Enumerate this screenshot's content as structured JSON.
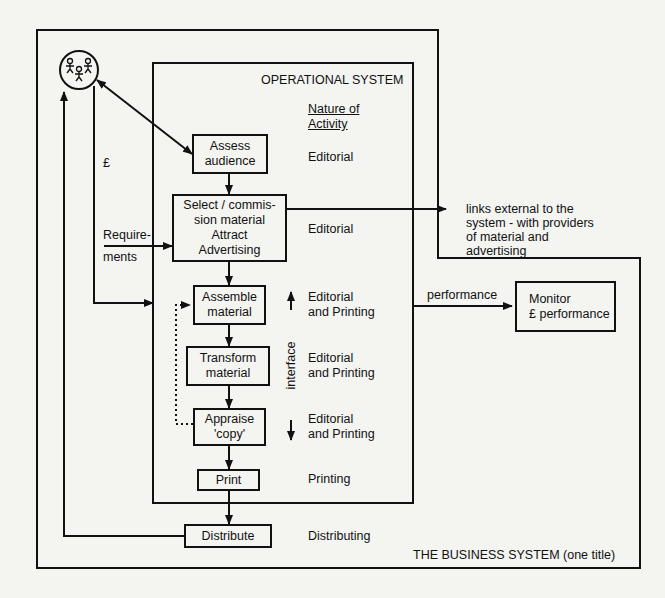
{
  "business_system": {
    "label": "THE BUSINESS SYSTEM (one title)"
  },
  "operational_system": {
    "label": "OPERATIONAL SYSTEM",
    "activity_header": [
      "Nature of",
      "Activity"
    ]
  },
  "audience": {
    "icon": "people-group-icon",
    "money_label": "£"
  },
  "requirements_label": [
    "Require-",
    "ments"
  ],
  "interface_label": "interface",
  "processes": [
    {
      "id": "assess",
      "lines": [
        "Assess",
        "audience"
      ],
      "activity": [
        "Editorial"
      ]
    },
    {
      "id": "select",
      "lines": [
        "Select / commis-",
        "sion material",
        "Attract",
        "Advertising"
      ],
      "activity": [
        "Editorial"
      ]
    },
    {
      "id": "assemble",
      "lines": [
        "Assemble",
        "material"
      ],
      "activity": [
        "Editorial",
        "and Printing"
      ]
    },
    {
      "id": "transform",
      "lines": [
        "Transform",
        "material"
      ],
      "activity": [
        "Editorial",
        "and Printing"
      ]
    },
    {
      "id": "appraise",
      "lines": [
        "Appraise",
        "'copy'"
      ],
      "activity": [
        "Editorial",
        "and Printing"
      ]
    },
    {
      "id": "print",
      "lines": [
        "Print"
      ],
      "activity": [
        "Printing"
      ]
    },
    {
      "id": "distribute",
      "lines": [
        "Distribute"
      ],
      "activity": [
        "Distributing"
      ]
    }
  ],
  "external_links": [
    "links external to the",
    "system - with providers",
    "of material and",
    "advertising"
  ],
  "performance_label": "performance",
  "monitor": {
    "lines": [
      "Monitor",
      "£ performance"
    ]
  }
}
